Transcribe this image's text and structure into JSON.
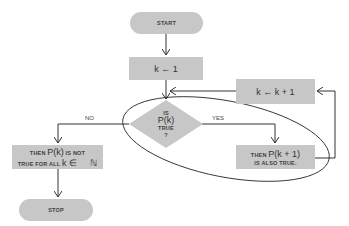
{
  "diagram": {
    "type": "flowchart",
    "colors": {
      "fill": "#c7c7c7",
      "stroke": "#333333",
      "background": "#ffffff"
    },
    "nodes": {
      "start": {
        "label": "START"
      },
      "init": {
        "label": "k ← 1"
      },
      "decision": {
        "line1": "IS",
        "line2": "P(k)",
        "line3": "TRUE",
        "line4": "?"
      },
      "increment": {
        "label": "k ← k + 1"
      },
      "yes_result": {
        "prefix": "THEN ",
        "expr": "P(k + 1)",
        "line2": "IS ALSO TRUE."
      },
      "no_result": {
        "prefix": "THEN ",
        "expr": "P(k)",
        "suffix": " IS NOT",
        "line2a": "TRUE FOR ALL ",
        "line2b": "k ∈",
        "line2c": "ℕ"
      },
      "stop": {
        "label": "STOP"
      }
    },
    "edge_labels": {
      "no": "NO",
      "yes": "YES"
    }
  }
}
